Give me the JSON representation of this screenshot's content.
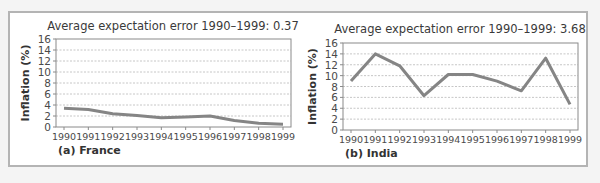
{
  "chart_data": [
    {
      "type": "line",
      "title": "Average expectation error 1990–1999: 0.37",
      "panel_label": "(a) France",
      "xlabel": "",
      "ylabel": "Inflation (%)",
      "ylim": [
        0,
        16
      ],
      "yticks": [
        "0",
        "2",
        "4",
        "6",
        "8",
        "10",
        "12",
        "14",
        "16"
      ],
      "categories": [
        "1990",
        "1991",
        "1992",
        "1993",
        "1994",
        "1995",
        "1996",
        "1997",
        "1998",
        "1999"
      ],
      "series": [
        {
          "name": "France",
          "values": [
            3.4,
            3.2,
            2.4,
            2.1,
            1.7,
            1.8,
            2.0,
            1.2,
            0.7,
            0.5
          ]
        }
      ],
      "grid": true,
      "legend": "none"
    },
    {
      "type": "line",
      "title": "Average expectation error 1990–1999: 3.68",
      "panel_label": "(b) India",
      "xlabel": "",
      "ylabel": "Inflation (%)",
      "ylim": [
        0,
        16
      ],
      "yticks": [
        "0",
        "2",
        "4",
        "6",
        "8",
        "10",
        "12",
        "14",
        "16"
      ],
      "categories": [
        "1990",
        "1991",
        "1992",
        "1993",
        "1994",
        "1995",
        "1996",
        "1997",
        "1998",
        "1999"
      ],
      "series": [
        {
          "name": "India",
          "values": [
            9.0,
            14.0,
            11.8,
            6.3,
            10.2,
            10.2,
            9.0,
            7.2,
            13.2,
            4.7
          ]
        }
      ],
      "grid": true,
      "legend": "none"
    }
  ],
  "colors": {
    "line": "#858585",
    "grid": "#b8b8b8",
    "frame": "#b4b4b4"
  }
}
